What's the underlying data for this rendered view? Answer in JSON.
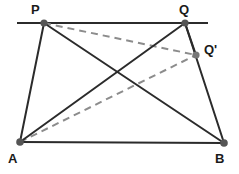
{
  "figure": {
    "kind": "geometry-diagram",
    "canvas": {
      "width": 239,
      "height": 174
    },
    "background_color": "#ffffff",
    "solid_color": "#2b2b2b",
    "dashed_color": "#8c8c8c",
    "vertex_color": "#555555",
    "points": {
      "P": {
        "label": "P",
        "x": 44,
        "y": 23,
        "label_x": 31,
        "label_y": 3
      },
      "Q": {
        "label": "Q",
        "x": 185,
        "y": 23,
        "label_x": 179,
        "label_y": 3
      },
      "Qp": {
        "label": "Q'",
        "x": 196,
        "y": 55,
        "label_x": 204,
        "label_y": 43
      },
      "A": {
        "label": "A",
        "x": 20,
        "y": 142,
        "label_x": 8,
        "label_y": 152
      },
      "B": {
        "label": "B",
        "x": 224,
        "y": 143,
        "label_x": 215,
        "label_y": 152
      }
    },
    "top_line": {
      "x1": 17,
      "y1": 23,
      "x2": 208,
      "y2": 23
    },
    "solid_segments": [
      {
        "name": "segment-A-P",
        "x1": 20,
        "y1": 142,
        "x2": 44,
        "y2": 23
      },
      {
        "name": "segment-A-B",
        "x1": 20,
        "y1": 142,
        "x2": 224,
        "y2": 143
      },
      {
        "name": "segment-Q-B",
        "x1": 185,
        "y1": 23,
        "x2": 224,
        "y2": 143
      },
      {
        "name": "segment-A-Q",
        "x1": 20,
        "y1": 142,
        "x2": 185,
        "y2": 23
      },
      {
        "name": "segment-P-B",
        "x1": 44,
        "y1": 23,
        "x2": 224,
        "y2": 143
      },
      {
        "name": "segment-Q-Qprime",
        "x1": 185,
        "y1": 23,
        "x2": 196,
        "y2": 55
      }
    ],
    "dashed_segments": [
      {
        "name": "segment-P-Qprime",
        "x1": 44,
        "y1": 23,
        "x2": 196,
        "y2": 55
      },
      {
        "name": "segment-A-Qprime",
        "x1": 20,
        "y1": 142,
        "x2": 196,
        "y2": 55
      }
    ]
  }
}
